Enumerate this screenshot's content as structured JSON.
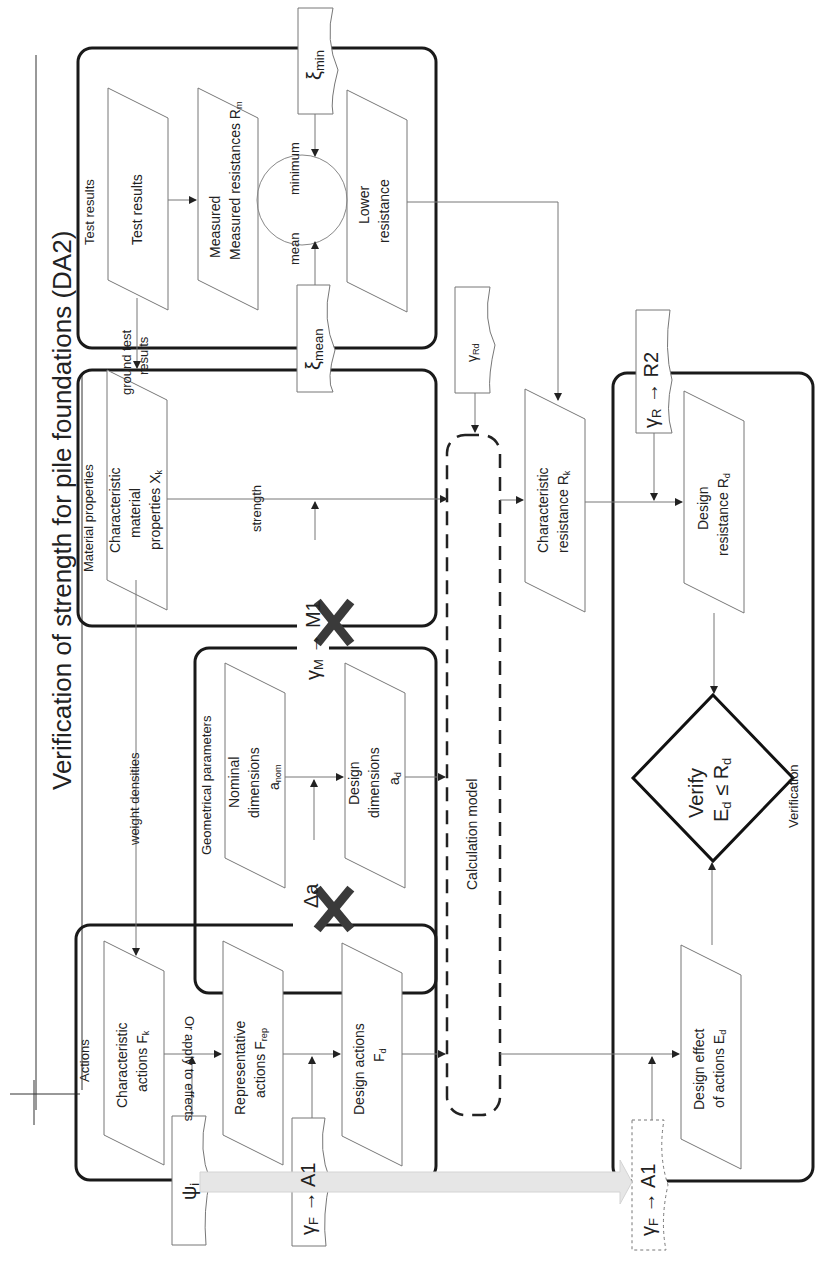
{
  "title": "Verification of strength for pile foundations (DA2)",
  "groups": {
    "test_results": "Test results",
    "material_properties": "Material properties",
    "geometrical_parameters": "Geometrical parameters",
    "actions": "Actions",
    "verification": "Verification"
  },
  "nodes": {
    "test_results": "Test results",
    "measured_resistances": "Measured resistances R",
    "measured_resistances_sub": "m",
    "lower_resistance_1": "Lower",
    "lower_resistance_2": "resistance",
    "char_material_1": "Characteristic",
    "char_material_2": "material",
    "char_material_3": "properties X",
    "char_material_sub": "k",
    "nominal_dims_1": "Nominal",
    "nominal_dims_2": "dimensions",
    "nominal_dims_3": "a",
    "nominal_dims_sub": "nom",
    "design_dims_1": "Design",
    "design_dims_2": "dimensions",
    "design_dims_3": "a",
    "design_dims_sub": "d",
    "char_actions_1": "Characteristic",
    "char_actions_2": "actions F",
    "char_actions_sub": "k",
    "rep_actions_1": "Representative",
    "rep_actions_2": "actions F",
    "rep_actions_sub": "rep",
    "design_actions_1": "Design actions",
    "design_actions_2": "F",
    "design_actions_sub": "d",
    "calc_model": "Calculation model",
    "char_resistance_1": "Characteristic",
    "char_resistance_2": "resistance R",
    "char_resistance_sub": "k",
    "design_resistance_1": "Design",
    "design_resistance_2": "resistance R",
    "design_resistance_sub": "d",
    "design_effect_1": "Design effect",
    "design_effect_2": "of actions E",
    "design_effect_sub": "d",
    "verify_1": "Verify",
    "verify_2": "E",
    "verify_2_sub": "d",
    "verify_op": " ≤ R",
    "verify_op_sub": "d"
  },
  "factors": {
    "xi_min": "ξ",
    "xi_min_sub": "min",
    "xi_mean": "ξ",
    "xi_mean_sub": "mean",
    "gamma_rd": "γ",
    "gamma_rd_sub": "Rd",
    "gamma_r": "γ",
    "gamma_r_sub": "R",
    "gamma_r_set": " → R2",
    "gamma_m": "γ",
    "gamma_m_sub": "M",
    "gamma_m_set": " → M1",
    "delta_a": "Δa",
    "psi": "ψ",
    "psi_sub": "i",
    "gamma_f": "γ",
    "gamma_f_sub": "F",
    "gamma_f_set": " → A1",
    "gamma_f2": "γ",
    "gamma_f2_sub": "F",
    "gamma_f2_set": " → A1"
  },
  "edge_labels": {
    "minimum": "minimum",
    "mean": "mean",
    "ground_test_results_1": "ground test",
    "ground_test_results_2": "results",
    "strength": "strength",
    "weight_densities": "weight densities",
    "or_apply_to_effects": "Or apply to effects"
  },
  "colors": {
    "frame": "#1a1a1a",
    "thin_line": "#8a8a8a",
    "cross_mark": "#3a3a3a",
    "arrow_fill": "#e4e4e4"
  }
}
